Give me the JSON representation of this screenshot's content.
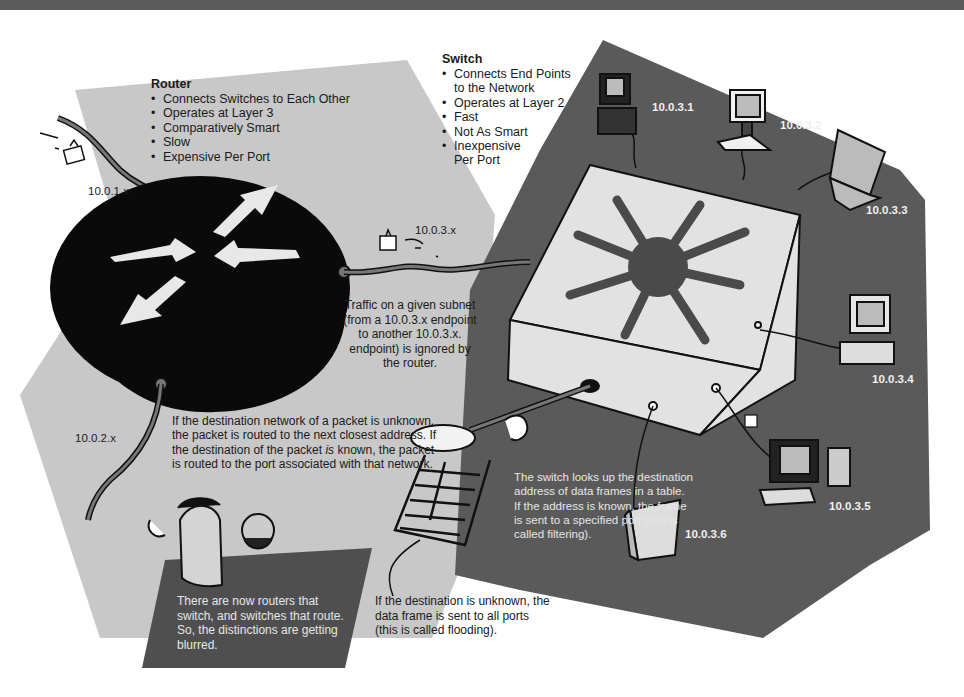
{
  "router": {
    "title": "Router",
    "bullets": [
      "Connects Switches to Each Other",
      "Operates at Layer 3",
      "Comparatively Smart",
      "Slow",
      "Expensive Per Port"
    ]
  },
  "switch": {
    "title": "Switch",
    "bullets": [
      "Connects End Points to the Network",
      "Operates at Layer 2",
      "Fast",
      "Not As Smart",
      "Inexpensive Per Port"
    ]
  },
  "subnet_labels": {
    "router_top": "10.0.1.x",
    "router_bottom": "10.0.2.x",
    "switch_link": "10.0.3.x"
  },
  "devices": [
    {
      "name": "desktop-tower",
      "ip": "10.0.3.1"
    },
    {
      "name": "desktop-keyboard",
      "ip": "10.0.3.2"
    },
    {
      "name": "laptop",
      "ip": "10.0.3.3"
    },
    {
      "name": "desktop-flat",
      "ip": "10.0.3.4"
    },
    {
      "name": "workstation",
      "ip": "10.0.3.5"
    },
    {
      "name": "server-tower",
      "ip": "10.0.3.6"
    }
  ],
  "notes": {
    "subnet_traffic": "Traffic on a given subnet (from a 10.0.3.x endpoint to another 10.0.3.x. endpoint) is ignored by the router.",
    "routing_pre": "If the destination network of a packet is unknown, the packet is routed to the next closest address. If the destination of the packet ",
    "routing_em": "is",
    "routing_post": " known, the packet is routed to the port associated with that network.",
    "switch_lookup": "The switch looks up the destination address of data frames in a table. If the address is known, the frame is sent to a specified port (this is called filtering).",
    "flooding": "If the destination is unknown, the data frame is sent to all ports (this is called flooding).",
    "blurred": "There are now routers that switch, and switches that route. So, the distinctions are getting blurred."
  },
  "colors": {
    "router_region": "#c8c8c8",
    "switch_region": "#5a5a5a",
    "router_body": "#0a0a0a",
    "switch_body": "#e2e2e2",
    "arrows": "#4a4a4a",
    "top_band": "#5c5c5c"
  }
}
